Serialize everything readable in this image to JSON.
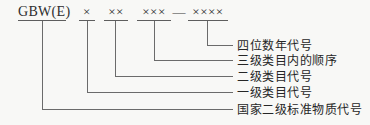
{
  "diagram": {
    "title_meaning": "code structure of national secondary certified reference material number",
    "code_parts": [
      {
        "text": "GBW(E)"
      },
      {
        "text": "×"
      },
      {
        "text": "××"
      },
      {
        "text": "×××"
      },
      {
        "text": "××××"
      }
    ],
    "separator": "—",
    "callouts": [
      {
        "text": "四位数年代号"
      },
      {
        "text": "三级类目内的顺序"
      },
      {
        "text": "二级类目代号"
      },
      {
        "text": "一级类目代号"
      },
      {
        "text": "国家二级标准物质代号"
      }
    ],
    "colors": {
      "background": "#f8f8f6",
      "line": "#6b6b6b",
      "text": "#2e2e2e"
    }
  }
}
